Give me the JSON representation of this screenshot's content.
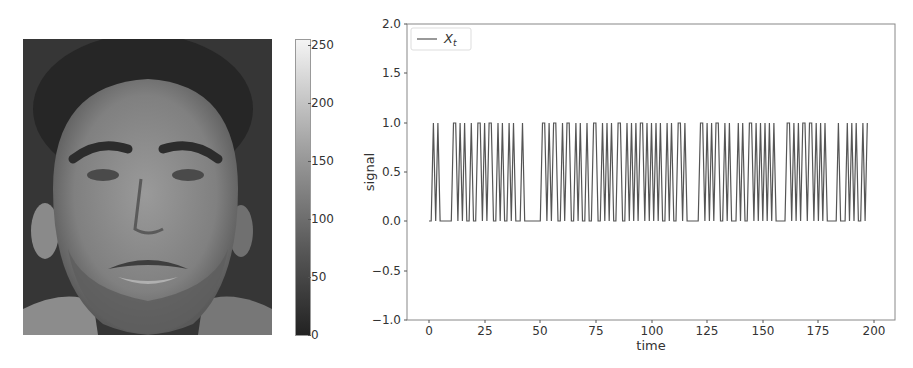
{
  "figure": {
    "image_panel": {
      "subject": "grayscale face photograph",
      "colormap": "gray"
    },
    "colorbar": {
      "ticks": [
        "0",
        "50",
        "100",
        "150",
        "200",
        "250"
      ],
      "range": [
        0,
        255
      ]
    }
  },
  "chart_data": {
    "type": "line",
    "title": "",
    "xlabel": "time",
    "ylabel": "signal",
    "xlim": [
      -9,
      210
    ],
    "ylim": [
      -1.0,
      2.0
    ],
    "xticks": [
      "0",
      "25",
      "50",
      "75",
      "100",
      "125",
      "150",
      "175",
      "200"
    ],
    "yticks": [
      "−1.0",
      "−0.5",
      "0.0",
      "0.5",
      "1.0",
      "1.5",
      "2.0"
    ],
    "grid": false,
    "legend": {
      "position": "upper left",
      "entries": [
        "X_t"
      ],
      "label_display": "X",
      "label_sub": "t"
    },
    "series": [
      {
        "name": "X_t",
        "color": "#555555",
        "x_start": 0,
        "values": [
          0,
          0,
          1,
          0,
          1,
          0,
          0,
          0,
          0,
          0,
          0,
          1,
          1,
          0,
          1,
          0,
          1,
          0,
          0,
          1,
          0,
          0,
          1,
          1,
          0,
          1,
          0,
          1,
          1,
          0,
          0,
          1,
          0,
          1,
          0,
          0,
          1,
          0,
          1,
          0,
          0,
          0,
          1,
          0,
          0,
          0,
          0,
          0,
          0,
          0,
          0,
          1,
          1,
          0,
          1,
          0,
          1,
          1,
          0,
          0,
          1,
          0,
          1,
          1,
          0,
          0,
          1,
          0,
          1,
          0,
          0,
          1,
          0,
          0,
          1,
          1,
          0,
          0,
          1,
          0,
          1,
          0,
          1,
          0,
          0,
          1,
          1,
          0,
          0,
          1,
          0,
          1,
          0,
          1,
          0,
          1,
          1,
          0,
          1,
          0,
          1,
          0,
          1,
          0,
          1,
          0,
          0,
          1,
          0,
          1,
          0,
          0,
          1,
          1,
          0,
          1,
          0,
          0,
          0,
          0,
          0,
          0,
          1,
          1,
          0,
          1,
          0,
          1,
          0,
          1,
          1,
          0,
          0,
          1,
          0,
          1,
          0,
          0,
          0,
          1,
          0,
          1,
          0,
          0,
          1,
          1,
          0,
          1,
          0,
          1,
          0,
          1,
          0,
          1,
          0,
          1,
          0,
          0,
          0,
          0,
          0,
          1,
          1,
          0,
          1,
          0,
          1,
          0,
          1,
          1,
          0,
          1,
          1,
          0,
          1,
          0,
          1,
          0,
          1,
          0,
          0,
          0,
          0,
          0,
          1,
          0,
          0,
          0,
          1,
          0,
          1,
          0,
          1,
          0,
          0,
          1,
          0,
          1
        ]
      }
    ]
  }
}
